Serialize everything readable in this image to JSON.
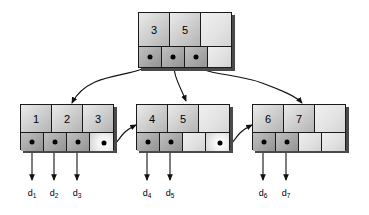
{
  "diagram": {
    "stroke_color": "#111111",
    "node_fill": "#c8c8c8",
    "shadow_color": "#4a4a4a"
  },
  "root": {
    "name": "root-node",
    "keys": [
      "3",
      "5",
      ""
    ],
    "pointers": [
      "filled",
      "filled",
      "filled",
      "empty"
    ]
  },
  "leaves": [
    {
      "name": "leaf-node-1",
      "keys": [
        "1",
        "2",
        "3"
      ],
      "pointers": [
        "filled",
        "filled",
        "filled",
        "sibling"
      ]
    },
    {
      "name": "leaf-node-2",
      "keys": [
        "4",
        "5",
        ""
      ],
      "pointers": [
        "filled",
        "filled",
        "empty",
        "sibling"
      ]
    },
    {
      "name": "leaf-node-3",
      "keys": [
        "6",
        "7",
        ""
      ],
      "pointers": [
        "filled",
        "filled",
        "empty",
        "empty"
      ]
    }
  ],
  "records": [
    {
      "base": "d",
      "sub": "1"
    },
    {
      "base": "d",
      "sub": "2"
    },
    {
      "base": "d",
      "sub": "3"
    },
    {
      "base": "d",
      "sub": "4"
    },
    {
      "base": "d",
      "sub": "5"
    },
    {
      "base": "d",
      "sub": "6"
    },
    {
      "base": "d",
      "sub": "7"
    }
  ]
}
